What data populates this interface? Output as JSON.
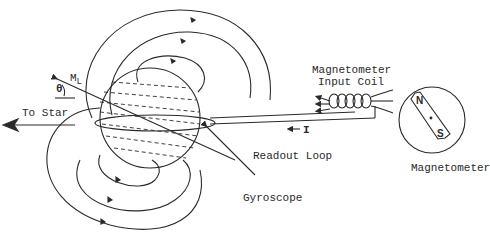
{
  "diagram": {
    "type": "schematic",
    "labels": {
      "to_star": "To Star",
      "m_l_main": "M",
      "m_l_sub": "L",
      "theta": "θ",
      "magnetometer_input_coil_line1": "Magnetometer",
      "magnetometer_input_coil_line2": "Input Coil",
      "current": "I",
      "readout_loop": "Readout Loop",
      "gyroscope": "Gyroscope",
      "magnetometer": "Magnetometer",
      "compass_north": "N",
      "compass_south": "S"
    },
    "colors": {
      "ink": "#2a2a2a",
      "background": "#ffffff"
    }
  }
}
